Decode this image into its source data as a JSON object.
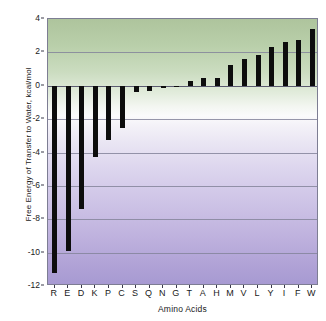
{
  "chart_data": {
    "type": "bar",
    "title": "",
    "xlabel": "Amino Acids",
    "ylabel": "Free Energy of Transfer to Water, kcal/mol",
    "categories": [
      "R",
      "E",
      "D",
      "K",
      "P",
      "C",
      "S",
      "Q",
      "N",
      "G",
      "T",
      "A",
      "H",
      "M",
      "V",
      "L",
      "Y",
      "I",
      "F",
      "W"
    ],
    "values": [
      -11.2,
      -9.9,
      -7.4,
      -4.25,
      -3.25,
      -2.55,
      -0.4,
      -0.3,
      -0.15,
      -0.02,
      0.3,
      0.45,
      0.45,
      1.25,
      1.6,
      1.85,
      2.3,
      2.65,
      2.75,
      3.4
    ],
    "ylim": [
      -12,
      4
    ],
    "ytick_values": [
      4,
      2,
      0,
      -2,
      -4,
      -6,
      -8,
      -10,
      -12
    ],
    "ytick_labels": [
      "4",
      "2",
      "0",
      "-2",
      "-4",
      "-6",
      "-8",
      "-10",
      "-12"
    ],
    "grid": true,
    "legend": "none",
    "series_color": "#0d0d0d",
    "background_gradient_top": "#aec49d",
    "background_gradient_bottom": "#a79ad2",
    "axis_color": "#7d7d93"
  }
}
